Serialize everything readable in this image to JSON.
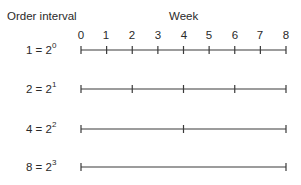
{
  "header": {
    "left_title": "Order interval",
    "top_title": "Week"
  },
  "axis": {
    "ticks": [
      "0",
      "1",
      "2",
      "3",
      "4",
      "5",
      "6",
      "7",
      "8"
    ]
  },
  "rows": [
    {
      "base": "1 = 2",
      "exp": "0",
      "interval": 1,
      "marks": [
        0,
        1,
        2,
        3,
        4,
        5,
        6,
        7,
        8
      ]
    },
    {
      "base": "2 = 2",
      "exp": "1",
      "interval": 2,
      "marks": [
        0,
        2,
        4,
        6,
        8
      ]
    },
    {
      "base": "4 = 2",
      "exp": "2",
      "interval": 4,
      "marks": [
        0,
        4,
        8
      ]
    },
    {
      "base": "8 = 2",
      "exp": "3",
      "interval": 8,
      "marks": [
        0,
        8
      ]
    }
  ],
  "colors": {
    "line": "#3a3a3a",
    "text": "#2a2a2a"
  }
}
